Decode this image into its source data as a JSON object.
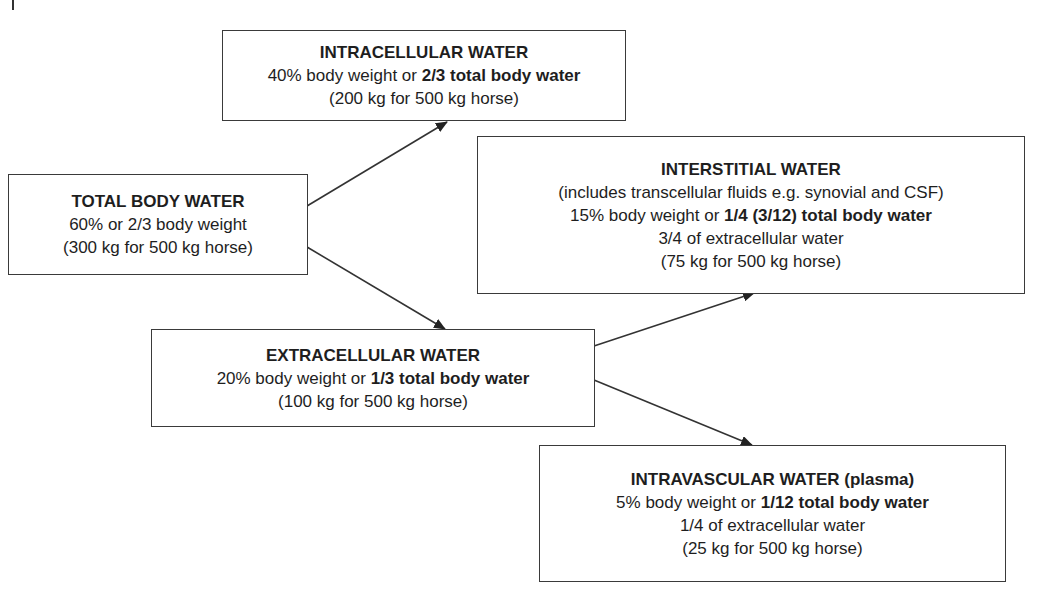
{
  "diagram": {
    "boxes": {
      "intracellular": {
        "title": "INTRACELLULAR WATER",
        "line1_normal": "40% body weight or ",
        "line1_bold": "2/3 total body water",
        "line2": "(200 kg for 500 kg horse)"
      },
      "total": {
        "title": "TOTAL BODY WATER",
        "line1": "60% or 2/3 body weight",
        "line2": "(300 kg for 500 kg horse)"
      },
      "interstitial": {
        "title": "INTERSTITIAL WATER",
        "line1": "(includes transcellular fluids e.g. synovial and CSF)",
        "line2_normal": "15% body weight or ",
        "line2_bold": "1/4 (3/12) total body water",
        "line3": "3/4 of extracellular water",
        "line4": "(75 kg for 500 kg horse)"
      },
      "extracellular": {
        "title": "EXTRACELLULAR WATER",
        "line1_normal": "20% body weight or ",
        "line1_bold": "1/3 total body water",
        "line2": "(100 kg for 500 kg horse)"
      },
      "intravascular": {
        "title": "INTRAVASCULAR WATER (plasma)",
        "line1_normal": "5% body weight or ",
        "line1_bold": "1/12 total body water",
        "line2": "1/4 of extracellular water",
        "line3": "(25 kg for 500 kg horse)"
      }
    },
    "edges": [
      {
        "from": "total",
        "to": "intracellular"
      },
      {
        "from": "total",
        "to": "extracellular"
      },
      {
        "from": "extracellular",
        "to": "interstitial"
      },
      {
        "from": "extracellular",
        "to": "intravascular"
      }
    ],
    "colors": {
      "line": "#333333",
      "text": "#1e1e1e",
      "background": "#ffffff"
    }
  }
}
